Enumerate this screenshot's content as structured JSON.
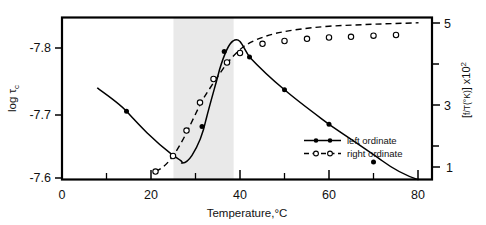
{
  "figure": {
    "kind": "scientific-plot",
    "width": 486,
    "height": 225,
    "background": "#ffffff",
    "frame_color": "#000000"
  },
  "chart_data": {
    "type": "line",
    "title": "",
    "subtitle": "",
    "xlabel": "Temperature,°C",
    "ylabel": "log τc",
    "ylabel_right": "[f/T(°K)] x10²",
    "xlim": [
      0,
      83
    ],
    "ylim_left": [
      -7.57,
      -7.845
    ],
    "ylim_right": [
      0.35,
      5.45
    ],
    "left_axis_inverted": true,
    "grid": false,
    "legend_position": "center-right-inside",
    "xticks": [
      0,
      20,
      40,
      60,
      80
    ],
    "xticklabels": [
      "0",
      "20",
      "40",
      "60",
      "80"
    ],
    "xticks_minor": [
      10,
      30,
      50,
      70
    ],
    "yticks_left": [
      -7.8,
      -7.7,
      -7.6
    ],
    "yticklabels_left": [
      "-7.8",
      "-7.7",
      "-7.6"
    ],
    "yticks_right": [
      5,
      3,
      1
    ],
    "yticklabels_right": [
      "5",
      "3",
      "1"
    ],
    "yticks_right_minor": [
      4,
      2
    ],
    "shaded_band": {
      "label": "transition region",
      "x_start": 25.0,
      "x_end": 38.5,
      "color": "#e9e9e9"
    },
    "series": [
      {
        "name": "left ordinate",
        "axis": "left",
        "style": "solid",
        "marker": "filled-circle",
        "color": "#000000",
        "x": [
          8.0,
          14.5,
          20.5,
          25.0,
          27.0,
          29.0,
          31.5,
          34.0,
          36.5,
          38.5,
          40.0,
          42.0,
          45.0,
          50.0,
          60.0,
          70.0
        ],
        "y": [
          -7.672,
          -7.722,
          -7.782,
          -7.812,
          -7.818,
          -7.812,
          -7.793,
          -7.76,
          -7.704,
          -7.648,
          -7.633,
          -7.632,
          -7.645,
          -7.667,
          -7.726,
          -7.787
        ],
        "markers_x": [
          14.5,
          25.0,
          31.5,
          36.5,
          42.0,
          50.0,
          60.0,
          70.0
        ],
        "markers_y": [
          -7.722,
          -7.812,
          -7.793,
          -7.704,
          -7.632,
          -7.667,
          -7.726,
          -7.787
        ]
      },
      {
        "name": "right ordinate",
        "axis": "right",
        "style": "dashed",
        "marker": "open-circle",
        "color": "#000000",
        "x": [
          21.0,
          25.0,
          28.0,
          31.0,
          34.0,
          37.0,
          40.0,
          45.0,
          50.0,
          55.0,
          60.0,
          65.0,
          70.0,
          75.0
        ],
        "y": [
          0.58,
          1.3,
          2.2,
          3.05,
          3.72,
          4.18,
          4.45,
          4.7,
          4.78,
          4.84,
          4.88,
          4.9,
          4.93,
          4.95
        ],
        "markers_x": [
          21.0,
          25.0,
          28.0,
          31.0,
          34.0,
          37.0,
          40.0,
          45.0,
          50.0,
          55.0,
          60.0,
          65.0,
          70.0,
          75.0
        ],
        "markers_y": [
          0.58,
          1.3,
          2.2,
          3.05,
          3.72,
          4.18,
          4.45,
          4.7,
          4.78,
          4.84,
          4.88,
          4.9,
          4.93,
          4.95
        ]
      }
    ],
    "legend": [
      {
        "label": "left ordinate",
        "style": "solid",
        "marker": "filled-circle"
      },
      {
        "label": "right ordinate",
        "style": "dashed",
        "marker": "open-circle"
      }
    ]
  },
  "labels": {
    "y_left_main": "log",
    "y_left_tau": "τ",
    "y_left_sub": "c",
    "y_right_open": "[",
    "y_right_frac": "f/T(°K)",
    "y_right_close": "]",
    "y_right_mult": " x10",
    "y_right_exp": "2",
    "x_title": "Temperature,°C"
  }
}
